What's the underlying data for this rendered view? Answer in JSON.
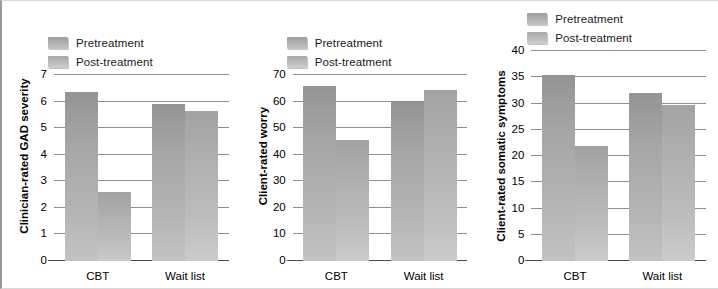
{
  "figure": {
    "background": "#ffffff",
    "border_color": "#9a9a9a",
    "series_colors": {
      "pretreatment": "#a8a8a8",
      "post_treatment": "#bcbcbc"
    }
  },
  "legend": {
    "pre_label": "Pretreatment",
    "post_label": "Post-treatment"
  },
  "chart_data": [
    {
      "type": "bar",
      "title": "",
      "xlabel": "",
      "ylabel": "Clinician-rated GAD severity",
      "categories": [
        "CBT",
        "Wait list"
      ],
      "series": [
        {
          "name": "Pretreatment",
          "values": [
            6.35,
            5.9
          ]
        },
        {
          "name": "Post-treatment",
          "values": [
            2.6,
            5.65
          ]
        }
      ],
      "ylim": [
        0,
        7
      ],
      "yticks": [
        0,
        1,
        2,
        3,
        4,
        5,
        6,
        7
      ],
      "grid": true,
      "legend_position": "top-left"
    },
    {
      "type": "bar",
      "title": "",
      "xlabel": "",
      "ylabel": "Client-rated worry",
      "categories": [
        "CBT",
        "Wait list"
      ],
      "series": [
        {
          "name": "Pretreatment",
          "values": [
            66,
            60
          ]
        },
        {
          "name": "Post-treatment",
          "values": [
            45.7,
            64.5
          ]
        }
      ],
      "ylim": [
        0,
        70
      ],
      "yticks": [
        0,
        10,
        20,
        30,
        40,
        50,
        60,
        70
      ],
      "grid": true,
      "legend_position": "top-left"
    },
    {
      "type": "bar",
      "title": "",
      "xlabel": "",
      "ylabel": "Client-rated somatic symptoms",
      "categories": [
        "CBT",
        "Wait list"
      ],
      "series": [
        {
          "name": "Pretreatment",
          "values": [
            35.4,
            32.0
          ]
        },
        {
          "name": "Post-treatment",
          "values": [
            22.0,
            29.8
          ]
        }
      ],
      "ylim": [
        0,
        40
      ],
      "yticks": [
        0,
        5,
        10,
        15,
        20,
        25,
        30,
        35,
        40
      ],
      "grid": true,
      "legend_position": "top-left"
    }
  ]
}
